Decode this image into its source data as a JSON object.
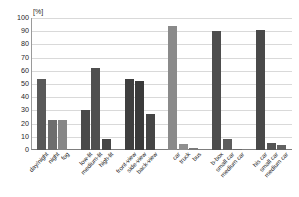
{
  "chart_data": {
    "type": "bar",
    "title": "",
    "subtitle": "",
    "xlabel": "",
    "ylabel": "",
    "unit_label": "[%]",
    "ylim": [
      0,
      100
    ],
    "ytick_step": 10,
    "yticks": [
      0,
      10,
      20,
      30,
      40,
      50,
      60,
      70,
      80,
      90,
      100
    ],
    "ytick_labels": [
      "0",
      "10",
      "20",
      "30",
      "40",
      "50",
      "60",
      "70",
      "80",
      "90",
      "100"
    ],
    "grid": true,
    "grid_axis": "y",
    "legend": false,
    "legend_position": "none",
    "categories": [
      "day/night",
      "night",
      "fog",
      "low-lit",
      "medium-lit",
      "high-lit",
      "front-view",
      "side-view",
      "back-view",
      "car",
      "truck",
      "bus",
      "b-box",
      "small car",
      "medium car",
      "large car",
      "his car",
      "small car",
      "medium car"
    ],
    "values": [
      54,
      23,
      23,
      30,
      62,
      8,
      54,
      52,
      27,
      94,
      4.5,
      1.5,
      90,
      8,
      0.8,
      0.8,
      91,
      5,
      4
    ],
    "groups": [
      {
        "name": "illumination-condition",
        "bars": [
          {
            "label": "day/night",
            "value": 54,
            "color": "#595959"
          },
          {
            "label": "night",
            "value": 23,
            "color": "#6e6e6e"
          },
          {
            "label": "fog",
            "value": 23,
            "color": "#878787"
          }
        ]
      },
      {
        "name": "lighting-level",
        "bars": [
          {
            "label": "low-lit",
            "value": 30,
            "color": "#4a4a4a"
          },
          {
            "label": "medium-lit",
            "value": 62,
            "color": "#4f4f4f"
          },
          {
            "label": "high-lit",
            "value": 8,
            "color": "#464646"
          }
        ]
      },
      {
        "name": "viewpoint",
        "bars": [
          {
            "label": "front-view",
            "value": 54,
            "color": "#3f3f3f"
          },
          {
            "label": "side-view",
            "value": 52,
            "color": "#3a3a3a"
          },
          {
            "label": "back-view",
            "value": 27,
            "color": "#454545"
          }
        ]
      },
      {
        "name": "vehicle-type",
        "bars": [
          {
            "label": "car",
            "value": 94,
            "color": "#8a8a8a"
          },
          {
            "label": "truck",
            "value": 4.5,
            "color": "#8f8f8f"
          },
          {
            "label": "bus",
            "value": 1.5,
            "color": "#7a7a7a"
          }
        ]
      },
      {
        "name": "box-size",
        "bars": [
          {
            "label": "b-box",
            "value": 90,
            "color": "#4d4d4d"
          },
          {
            "label": "small car",
            "value": 8,
            "color": "#5d5d5d"
          },
          {
            "label": "medium car",
            "value": 0.8,
            "color": "#6a6a6a"
          }
        ]
      },
      {
        "name": "car-size",
        "bars": [
          {
            "label": "his car",
            "value": 91,
            "color": "#494949"
          },
          {
            "label": "small car",
            "value": 5,
            "color": "#555555"
          },
          {
            "label": "medium car",
            "value": 4,
            "color": "#626262"
          }
        ]
      }
    ],
    "colors": {
      "grid": "#d9d9d9",
      "axis": "#7d7d7d",
      "background": "#ffffff",
      "bar_dark": "#3a3a3a",
      "bar_mid": "#595959",
      "bar_light": "#8a8a8a"
    }
  }
}
